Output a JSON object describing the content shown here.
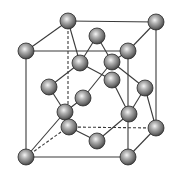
{
  "colors": {
    "line": "#3a3a3a",
    "atom_light": "#f4f4f4",
    "atom_mid": "#8c8c8c",
    "atom_dark": "#3c3c3c",
    "background": "#ffffff"
  },
  "atom_radius": 8,
  "cube": {
    "front_top_left": [
      26,
      51
    ],
    "front_top_right": [
      128,
      51
    ],
    "front_bottom_left": [
      26,
      157
    ],
    "front_bottom_right": [
      128,
      157
    ],
    "back_top_left": [
      68,
      21
    ],
    "back_top_right": [
      156,
      22
    ],
    "back_bottom_left": [
      68,
      127
    ],
    "back_bottom_right": [
      156,
      128
    ]
  },
  "edges_solid": [
    [
      [
        26,
        51
      ],
      [
        128,
        51
      ]
    ],
    [
      [
        26,
        51
      ],
      [
        26,
        157
      ]
    ],
    [
      [
        26,
        157
      ],
      [
        128,
        157
      ]
    ],
    [
      [
        128,
        51
      ],
      [
        128,
        157
      ]
    ],
    [
      [
        68,
        21
      ],
      [
        156,
        22
      ]
    ],
    [
      [
        156,
        22
      ],
      [
        156,
        128
      ]
    ],
    [
      [
        26,
        51
      ],
      [
        68,
        21
      ]
    ],
    [
      [
        128,
        51
      ],
      [
        156,
        22
      ]
    ],
    [
      [
        128,
        157
      ],
      [
        156,
        128
      ]
    ]
  ],
  "edges_dashed": [
    [
      [
        68,
        21
      ],
      [
        68,
        127
      ]
    ],
    [
      [
        68,
        127
      ],
      [
        156,
        128
      ]
    ],
    [
      [
        26,
        157
      ],
      [
        68,
        127
      ]
    ]
  ],
  "bonds": [
    [
      [
        97,
        36
      ],
      [
        80,
        63
      ]
    ],
    [
      [
        97,
        36
      ],
      [
        112,
        62
      ]
    ],
    [
      [
        80,
        63
      ],
      [
        68,
        21
      ]
    ],
    [
      [
        80,
        63
      ],
      [
        49,
        87
      ]
    ],
    [
      [
        80,
        63
      ],
      [
        112,
        80
      ]
    ],
    [
      [
        112,
        62
      ],
      [
        128,
        51
      ]
    ],
    [
      [
        112,
        62
      ],
      [
        145,
        88
      ]
    ],
    [
      [
        112,
        62
      ],
      [
        83,
        98
      ]
    ],
    [
      [
        49,
        87
      ],
      [
        65,
        112
      ]
    ],
    [
      [
        83,
        98
      ],
      [
        65,
        112
      ]
    ],
    [
      [
        65,
        112
      ],
      [
        26,
        157
      ]
    ],
    [
      [
        112,
        80
      ],
      [
        129,
        114
      ]
    ],
    [
      [
        145,
        88
      ],
      [
        129,
        114
      ]
    ],
    [
      [
        129,
        114
      ],
      [
        97,
        141
      ]
    ],
    [
      [
        69,
        127
      ],
      [
        97,
        141
      ]
    ],
    [
      [
        145,
        88
      ],
      [
        156,
        128
      ]
    ]
  ],
  "atoms": [
    {
      "id": "corner-back-top-left",
      "pos": [
        68,
        21
      ]
    },
    {
      "id": "corner-back-top-right",
      "pos": [
        156,
        22
      ]
    },
    {
      "id": "face-center-top",
      "pos": [
        97,
        36
      ]
    },
    {
      "id": "corner-front-top-left",
      "pos": [
        26,
        51
      ]
    },
    {
      "id": "corner-front-top-right",
      "pos": [
        128,
        51
      ]
    },
    {
      "id": "interior-1",
      "pos": [
        80,
        63
      ]
    },
    {
      "id": "interior-2",
      "pos": [
        112,
        62
      ]
    },
    {
      "id": "face-center-back",
      "pos": [
        112,
        80
      ]
    },
    {
      "id": "face-center-left",
      "pos": [
        49,
        87
      ]
    },
    {
      "id": "face-center-right",
      "pos": [
        145,
        88
      ]
    },
    {
      "id": "interior-3",
      "pos": [
        83,
        98
      ]
    },
    {
      "id": "face-center-front",
      "pos": [
        65,
        112
      ]
    },
    {
      "id": "interior-4",
      "pos": [
        129,
        114
      ]
    },
    {
      "id": "corner-back-bottom-left",
      "pos": [
        69,
        127
      ]
    },
    {
      "id": "corner-back-bottom-right",
      "pos": [
        156,
        128
      ]
    },
    {
      "id": "face-center-bottom",
      "pos": [
        97,
        141
      ]
    },
    {
      "id": "corner-front-bottom-left",
      "pos": [
        26,
        157
      ]
    },
    {
      "id": "corner-front-bottom-right",
      "pos": [
        128,
        157
      ]
    }
  ]
}
